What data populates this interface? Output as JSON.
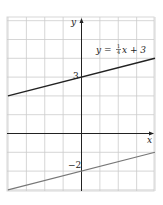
{
  "chart_data": {
    "type": "line",
    "title": "",
    "xlabel": "x",
    "ylabel": "y",
    "xlim": [
      -4,
      4
    ],
    "ylim": [
      -3.2,
      6.2
    ],
    "grid": true,
    "grid_step": 1,
    "series": [
      {
        "name": "y = 1/4 x + 3",
        "label": "y = ¼x + 3",
        "slope": 0.25,
        "intercept": 3,
        "x": [
          -4,
          4
        ],
        "y": [
          2,
          4
        ],
        "color": "#222222"
      },
      {
        "name": "y = 1/4 x - 2",
        "label": "",
        "slope": 0.25,
        "intercept": -2,
        "x": [
          -4,
          4
        ],
        "y": [
          -3,
          -1
        ],
        "color": "#777777"
      }
    ],
    "annotations": [
      {
        "text": "3",
        "x": 0,
        "y": 3
      },
      {
        "text": "−2",
        "x": 0,
        "y": -2
      }
    ]
  },
  "labels": {
    "x_axis": "x",
    "y_axis": "y",
    "equation_prefix": "y = ",
    "equation_frac_num": "1",
    "equation_frac_den": "4",
    "equation_suffix": "x + 3",
    "intercept_upper": "3",
    "intercept_lower": "−2"
  },
  "colors": {
    "grid": "#cccccc",
    "axis": "#222222",
    "line_upper": "#222222",
    "line_lower": "#777777",
    "background": "#ffffff",
    "frame": "#d8d8d8"
  }
}
